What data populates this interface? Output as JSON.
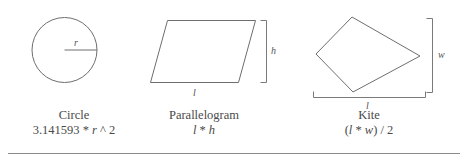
{
  "figure": {
    "background_color": "#ffffff",
    "stroke_color": "#6e6e6e",
    "text_color": "#4a4a4a"
  },
  "shapes": [
    {
      "key": "circle",
      "name": "Circle",
      "formula": "3.141593 * r ^ 2",
      "formula_parts": {
        "before": "3.141593 * ",
        "variable": "r",
        "after": " ^ 2"
      },
      "dimension_labels": [
        {
          "key": "radius",
          "text": "r"
        }
      ]
    },
    {
      "key": "parallelogram",
      "name": "Parallelogram",
      "formula": "l * h",
      "formula_parts": {
        "before": "",
        "variable": "l",
        "middle": " * ",
        "variable2": "h",
        "after": ""
      },
      "dimension_labels": [
        {
          "key": "height",
          "text": "h"
        },
        {
          "key": "length",
          "text": "l"
        }
      ]
    },
    {
      "key": "kite",
      "name": "Kite",
      "formula": "(l * w) / 2",
      "formula_parts": {
        "before": "(",
        "variable": "l",
        "middle": " * ",
        "variable2": "w",
        "after": ") / 2"
      },
      "dimension_labels": [
        {
          "key": "width",
          "text": "w"
        },
        {
          "key": "length",
          "text": "l"
        }
      ]
    }
  ]
}
